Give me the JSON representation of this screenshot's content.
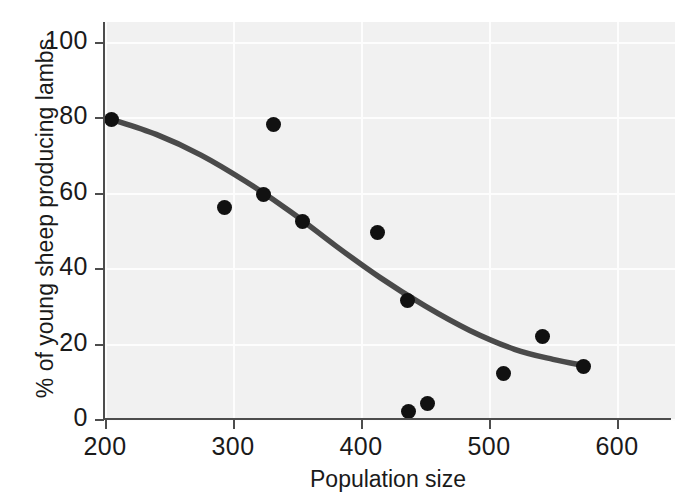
{
  "chart_data": {
    "type": "scatter",
    "title": "",
    "xlabel": "Population size",
    "ylabel": "% of young sheep producing lambs",
    "xlim": [
      200,
      640
    ],
    "ylim": [
      0,
      105
    ],
    "xticks": [
      200,
      300,
      400,
      500,
      600
    ],
    "yticks": [
      0,
      20,
      40,
      60,
      80,
      100
    ],
    "xtick_labels": [
      "200",
      "300",
      "400",
      "500",
      "600"
    ],
    "ytick_labels": [
      "0",
      "20",
      "40",
      "60",
      "80",
      "100"
    ],
    "grid": true,
    "legend": "none",
    "point_color": "#111111",
    "line_color": "#4a4a4a",
    "panel_color": "#f1f1f1",
    "points": [
      {
        "x": 205,
        "y": 79.5
      },
      {
        "x": 293,
        "y": 56.0
      },
      {
        "x": 332,
        "y": 78.0
      },
      {
        "x": 324,
        "y": 59.5
      },
      {
        "x": 354,
        "y": 52.5
      },
      {
        "x": 413,
        "y": 49.5
      },
      {
        "x": 436,
        "y": 31.5
      },
      {
        "x": 437,
        "y": 2.0
      },
      {
        "x": 452,
        "y": 4.0
      },
      {
        "x": 511,
        "y": 12.0
      },
      {
        "x": 542,
        "y": 22.0
      },
      {
        "x": 574,
        "y": 14.0
      }
    ],
    "fit_curve": {
      "description": "fitted declining curve",
      "points": [
        {
          "x": 205,
          "y": 79.5
        },
        {
          "x": 240,
          "y": 75.5
        },
        {
          "x": 275,
          "y": 70.0
        },
        {
          "x": 310,
          "y": 63.0
        },
        {
          "x": 345,
          "y": 55.0
        },
        {
          "x": 380,
          "y": 46.0
        },
        {
          "x": 415,
          "y": 37.5
        },
        {
          "x": 450,
          "y": 30.0
        },
        {
          "x": 485,
          "y": 23.5
        },
        {
          "x": 520,
          "y": 18.5
        },
        {
          "x": 550,
          "y": 15.8
        },
        {
          "x": 574,
          "y": 14.2
        }
      ]
    }
  }
}
